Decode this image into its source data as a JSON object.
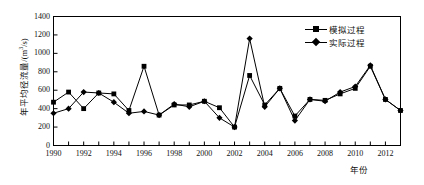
{
  "chart_data": {
    "type": "line",
    "title": "",
    "xlabel": "年份",
    "ylabel": "年平均径流量/(m³/s)",
    "ylabel_main": "年平均径流量/(m",
    "ylabel_sup": "3",
    "ylabel_tail": "/s)",
    "xlim": [
      1990,
      2013
    ],
    "ylim": [
      0,
      1400
    ],
    "grid": false,
    "legend_position": "top-right",
    "x": [
      1990,
      1991,
      1992,
      1993,
      1994,
      1995,
      1996,
      1997,
      1998,
      1999,
      2000,
      2001,
      2002,
      2003,
      2004,
      2005,
      2006,
      2007,
      2008,
      2009,
      2010,
      2011,
      2012,
      2013
    ],
    "xtick_labels": [
      "1990",
      "1992",
      "1994",
      "1996",
      "1998",
      "2000",
      "2002",
      "2004",
      "2006",
      "2008",
      "2010",
      "2012"
    ],
    "xticks": [
      1990,
      1992,
      1994,
      1996,
      1998,
      2000,
      2002,
      2004,
      2006,
      2008,
      2010,
      2012
    ],
    "ytick_labels": [
      "0",
      "200",
      "400",
      "600",
      "800",
      "1000",
      "1200",
      "1400"
    ],
    "yticks": [
      0,
      200,
      400,
      600,
      800,
      1000,
      1200,
      1400
    ],
    "series": [
      {
        "name": "模拟过程",
        "marker": "square",
        "color": "#000000",
        "values": [
          470,
          580,
          400,
          570,
          560,
          380,
          860,
          330,
          440,
          440,
          480,
          410,
          200,
          760,
          440,
          620,
          320,
          500,
          490,
          560,
          620,
          860,
          500,
          380
        ]
      },
      {
        "name": "实际过程",
        "marker": "diamond",
        "color": "#000000",
        "values": [
          350,
          400,
          580,
          570,
          470,
          350,
          370,
          330,
          450,
          420,
          480,
          300,
          200,
          1160,
          420,
          620,
          270,
          500,
          480,
          580,
          640,
          870,
          500,
          380
        ]
      }
    ]
  },
  "legend": {
    "items": [
      {
        "label": "模拟过程",
        "marker": "square"
      },
      {
        "label": "实际过程",
        "marker": "diamond"
      }
    ]
  },
  "axes": {
    "x_title": "年份",
    "y_title_main": "年平均径流量/(m",
    "y_title_sup": "3",
    "y_title_tail": "/s)"
  }
}
